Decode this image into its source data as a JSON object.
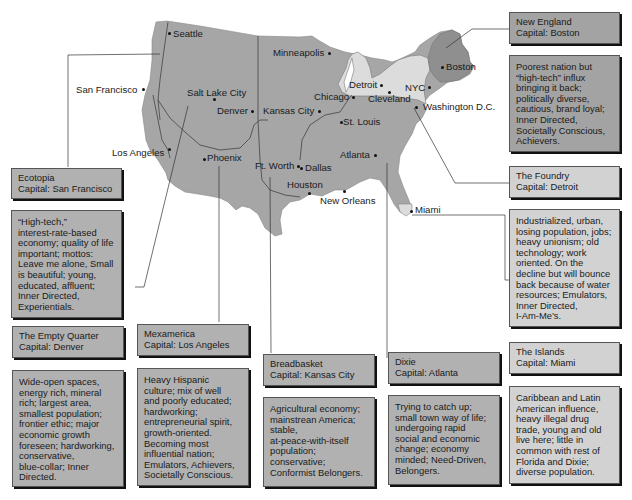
{
  "map": {
    "title_fragment_top": "",
    "cities": [
      {
        "name": "Seattle",
        "x": 172,
        "y": 30
      },
      {
        "name": "San Francisco",
        "x": 77,
        "y": 85
      },
      {
        "name": "Salt Lake City",
        "x": 187,
        "y": 89
      },
      {
        "name": "Denver",
        "x": 217,
        "y": 105
      },
      {
        "name": "Minneapolis",
        "x": 273,
        "y": 48
      },
      {
        "name": "Kansas City",
        "x": 263,
        "y": 105
      },
      {
        "name": "Chicago",
        "x": 314,
        "y": 71
      },
      {
        "name": "Detroit",
        "x": 349,
        "y": 80
      },
      {
        "name": "Cleveland",
        "x": 368,
        "y": 94
      },
      {
        "name": "NYC",
        "x": 405,
        "y": 83
      },
      {
        "name": "Boston",
        "x": 446,
        "y": 63
      },
      {
        "name": "Washington D.C.",
        "x": 423,
        "y": 105
      },
      {
        "name": "St. Louis",
        "x": 341,
        "y": 117
      },
      {
        "name": "Los Angeles",
        "x": 112,
        "y": 148
      },
      {
        "name": "Phoenix",
        "x": 207,
        "y": 155
      },
      {
        "name": "Ft. Worth",
        "x": 255,
        "y": 162
      },
      {
        "name": "Dallas",
        "x": 305,
        "y": 163
      },
      {
        "name": "Atlanta",
        "x": 340,
        "y": 150
      },
      {
        "name": "Houston",
        "x": 287,
        "y": 180
      },
      {
        "name": "New Orleans",
        "x": 320,
        "y": 196
      },
      {
        "name": "Miami",
        "x": 417,
        "y": 206
      }
    ]
  },
  "nations": [
    {
      "id": "ecotopia",
      "name": "Ecotopia",
      "capital_label": "Capital: San Francisco",
      "description": [
        "“High-tech,”",
        "interest-rate-based",
        "economy; quality of life",
        "important; mottos:",
        "Leave me alone, Small",
        "is beautiful; young,",
        "educated, affluent;",
        "Inner Directed,",
        "Experientials."
      ]
    },
    {
      "id": "empty-quarter",
      "name": "The Empty Quarter",
      "capital_label": "Capital: Denver",
      "description": [
        "Wide-open spaces,",
        "energy rich, mineral",
        "rich; largest area,",
        "smallest population;",
        "frontier ethic; major",
        "economic growth",
        "foreseen; hardworking,",
        "conservative,",
        "blue-collar; Inner",
        "Directed."
      ]
    },
    {
      "id": "mexamerica",
      "name": "Mexamerica",
      "capital_label": "Capital: Los Angeles",
      "description": [
        "Heavy Hispanic",
        "culture; mix of well",
        "and poorly educated;",
        "hardworking;",
        "entrepreneurial spirit,",
        "growth-oriented.",
        "Becoming most",
        "influential nation;",
        "Emulators, Achievers,",
        "Societally Conscious."
      ]
    },
    {
      "id": "breadbasket",
      "name": "Breadbasket",
      "capital_label": "Capital: Kansas City",
      "description": [
        "Agricultural economy;",
        "mainstrean America;",
        "stable,",
        "at-peace-with-itself",
        "population;",
        "conservative;",
        "Conformist Belongers."
      ]
    },
    {
      "id": "dixie",
      "name": "Dixie",
      "capital_label": "Capital: Atlanta",
      "description": [
        "Trying to catch up;",
        "small town way of life;",
        "undergoing rapid",
        "social and economic",
        "change; economy",
        "minded; Need-Driven,",
        "Belongers."
      ]
    },
    {
      "id": "new-england",
      "name": "New England",
      "capital_label": "Capital: Boston",
      "description": [
        "Poorest nation but",
        "“high-tech” influx",
        "bringing it back;",
        "politically diverse,",
        "cautious, brand loyal;",
        "Inner Directed,",
        "Societally Conscious,",
        "Achievers."
      ]
    },
    {
      "id": "foundry",
      "name": "The Foundry",
      "capital_label": "Capital: Detroit",
      "description": [
        "Industrialized, urban,",
        "losing population, jobs;",
        "heavy unionism; old",
        "technology; work",
        "oriented. On the",
        "decline but will bounce",
        "back because of water",
        "resources; Emulators,",
        "Inner Directed,",
        "I-Am-Me’s."
      ]
    },
    {
      "id": "islands",
      "name": "The Islands",
      "capital_label": "Capital: Miami",
      "description": [
        "Caribbean and Latin",
        "American influence,",
        "heavy illegal drug",
        "trade, young and old",
        "live here; little in",
        "common with rest of",
        "Florida and Dixie;",
        "diverse population."
      ]
    }
  ],
  "colors": {
    "land_main": "#a6a6a6",
    "land_foundry": "#dcdcdc",
    "land_new_england": "#8f8f8f",
    "box_dark": "#a3a3a3",
    "box_light": "#d2d2d2"
  }
}
